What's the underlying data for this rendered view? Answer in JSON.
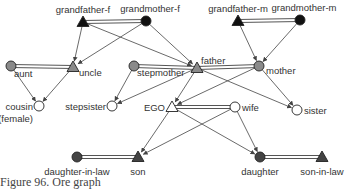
{
  "caption": "Figure 96. Ore graph",
  "colors": {
    "black": "#111111",
    "gray": "#8a8a8a",
    "dark": "#444444",
    "white": "#ffffff"
  },
  "nodes": [
    {
      "id": "grandfather-f",
      "label": "grandfather-f",
      "shape": "triangle",
      "fill": "black",
      "x": 83,
      "y": 22
    },
    {
      "id": "grandmother-f",
      "label": "grandmother-f",
      "shape": "circle",
      "fill": "black",
      "x": 146,
      "y": 21
    },
    {
      "id": "grandfather-m",
      "label": "grandfather-m",
      "shape": "triangle",
      "fill": "black",
      "x": 238,
      "y": 21
    },
    {
      "id": "grandmother-m",
      "label": "grandmother-m",
      "shape": "circle",
      "fill": "black",
      "x": 300,
      "y": 20
    },
    {
      "id": "aunt",
      "label": "aunt",
      "shape": "circle",
      "fill": "gray",
      "x": 11,
      "y": 66
    },
    {
      "id": "uncle",
      "label": "uncle",
      "shape": "triangle",
      "fill": "gray",
      "x": 73,
      "y": 67
    },
    {
      "id": "stepmother",
      "label": "stepmother",
      "shape": "circle",
      "fill": "gray",
      "x": 134,
      "y": 66
    },
    {
      "id": "father",
      "label": "father",
      "shape": "triangle",
      "fill": "gray",
      "x": 197,
      "y": 68
    },
    {
      "id": "mother",
      "label": "mother",
      "shape": "circle",
      "fill": "gray",
      "x": 259,
      "y": 66
    },
    {
      "id": "cousin",
      "label": "cousin",
      "label2": "(female)",
      "shape": "circle",
      "fill": "white",
      "x": 39,
      "y": 106
    },
    {
      "id": "stepsister",
      "label": "stepsister",
      "shape": "circle",
      "fill": "white",
      "x": 112,
      "y": 106
    },
    {
      "id": "ego",
      "label": "EGO",
      "shape": "triangle",
      "fill": "white",
      "x": 172,
      "y": 107
    },
    {
      "id": "wife",
      "label": "wife",
      "shape": "circle",
      "fill": "white",
      "x": 235,
      "y": 107
    },
    {
      "id": "sister",
      "label": "sister",
      "shape": "circle",
      "fill": "white",
      "x": 297,
      "y": 110
    },
    {
      "id": "daughter-in-law",
      "label": "daughter-in-law",
      "shape": "circle",
      "fill": "dark",
      "x": 77,
      "y": 157
    },
    {
      "id": "son",
      "label": "son",
      "shape": "triangle",
      "fill": "dark",
      "x": 138,
      "y": 157
    },
    {
      "id": "daughter",
      "label": "daughter",
      "shape": "circle",
      "fill": "dark",
      "x": 260,
      "y": 157
    },
    {
      "id": "son-in-law",
      "label": "son-in-law",
      "shape": "triangle",
      "fill": "dark",
      "x": 322,
      "y": 157
    }
  ],
  "marriages": [
    [
      "grandfather-f",
      "grandmother-f"
    ],
    [
      "grandfather-m",
      "grandmother-m"
    ],
    [
      "aunt",
      "uncle"
    ],
    [
      "stepmother",
      "father"
    ],
    [
      "father",
      "mother"
    ],
    [
      "ego",
      "wife"
    ],
    [
      "daughter-in-law",
      "son"
    ],
    [
      "daughter",
      "son-in-law"
    ]
  ],
  "descents": [
    [
      "grandfather-f",
      "uncle"
    ],
    [
      "grandmother-f",
      "uncle"
    ],
    [
      "grandfather-f",
      "father"
    ],
    [
      "grandmother-f",
      "father"
    ],
    [
      "grandfather-m",
      "mother"
    ],
    [
      "grandmother-m",
      "mother"
    ],
    [
      "aunt",
      "cousin"
    ],
    [
      "uncle",
      "cousin"
    ],
    [
      "stepmother",
      "stepsister"
    ],
    [
      "father",
      "stepsister"
    ],
    [
      "father",
      "ego"
    ],
    [
      "mother",
      "ego"
    ],
    [
      "father",
      "sister"
    ],
    [
      "mother",
      "sister"
    ],
    [
      "ego",
      "son"
    ],
    [
      "wife",
      "son"
    ],
    [
      "ego",
      "daughter"
    ],
    [
      "wife",
      "daughter"
    ]
  ]
}
